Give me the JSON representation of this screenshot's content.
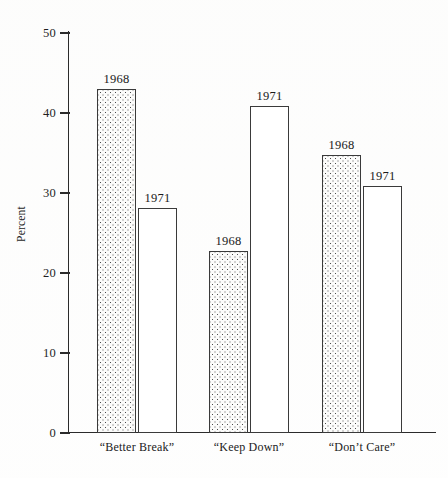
{
  "chart_data": {
    "type": "bar",
    "title": "",
    "subtitle": "",
    "xlabel": "",
    "ylabel": "Percent",
    "ylim": [
      0,
      50
    ],
    "yticks": [
      0,
      10,
      20,
      30,
      40,
      50
    ],
    "ytick_labels": [
      "0",
      "10",
      "20",
      "30",
      "40",
      "50"
    ],
    "grid": false,
    "legend": "none",
    "categories": [
      "“Better Break”",
      "“Keep Down”",
      "“Don’t Care”"
    ],
    "series": [
      {
        "name": "1968",
        "fill": "stipple",
        "values": [
          43.0,
          22.8,
          34.8
        ],
        "point_labels": [
          "1968",
          "1968",
          "1968"
        ]
      },
      {
        "name": "1971",
        "fill": "open",
        "values": [
          28.1,
          40.9,
          30.9
        ],
        "point_labels": [
          "1971",
          "1971",
          "1971"
        ]
      }
    ],
    "colors": {
      "axis": "#2b2b2b",
      "bar_outline": "#3a3a3a",
      "stipple_fill": "#fbfbfa",
      "open_fill": "#ffffff",
      "background": "#fefefe",
      "text": "#1a1a1a"
    }
  }
}
